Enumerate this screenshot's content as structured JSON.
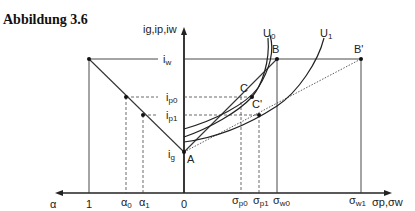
{
  "title": "Abbildung 3.6",
  "axes": {
    "y_label": "ig,ip,iw",
    "x_right_label": "σp,σw",
    "x_left_label": "α"
  },
  "y_ticks": {
    "iw": {
      "main": "i",
      "sub": "w"
    },
    "ip0": {
      "main": "i",
      "sub": "p0"
    },
    "ip1": {
      "main": "i",
      "sub": "p1"
    },
    "ig": {
      "main": "i",
      "sub": "g"
    }
  },
  "left_ticks": {
    "one": "1",
    "alpha0": {
      "main": "α",
      "sub": "0"
    },
    "alpha1": {
      "main": "α",
      "sub": "1"
    },
    "zero": "0"
  },
  "right_ticks": {
    "sp0": {
      "main": "σ",
      "sub": "p0"
    },
    "sp1": {
      "main": "σ",
      "sub": "p1"
    },
    "sw0": {
      "main": "σ",
      "sub": "w0"
    },
    "sw1": {
      "main": "σ",
      "sub": "w1"
    }
  },
  "points": {
    "A": "A",
    "B": "B",
    "B_prime": "B'",
    "C": "C",
    "C_prime": "C'"
  },
  "curves": {
    "U0": {
      "main": "U",
      "sub": "0"
    },
    "U1": {
      "main": "U",
      "sub": "1"
    }
  }
}
